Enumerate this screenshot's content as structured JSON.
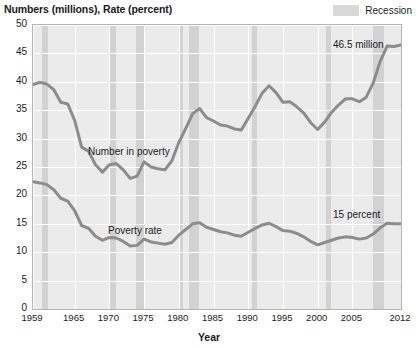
{
  "axis_title_y": "Numbers (millions), Rate (percent)",
  "axis_title_x": "Year",
  "legend": {
    "recession_label": "Recession",
    "recession_color": "#d2d2d2"
  },
  "annotations": {
    "number_in_poverty": "Number in poverty",
    "poverty_rate": "Poverty rate",
    "end_number": "46.5 million",
    "end_rate": "15 percent"
  },
  "chart_data": {
    "type": "line",
    "title": "",
    "subtitle": "",
    "xlabel": "Year",
    "ylabel": "Numbers (millions), Rate (percent)",
    "xlim": [
      1959,
      2012
    ],
    "ylim": [
      0,
      50
    ],
    "yticks": [
      0,
      5,
      10,
      15,
      20,
      25,
      30,
      35,
      40,
      45,
      50
    ],
    "xticks": [
      1959,
      1965,
      1970,
      1975,
      1980,
      1985,
      1990,
      1995,
      2000,
      2005,
      2012
    ],
    "grid": true,
    "legend_position": "top-right",
    "line_color": "#8c8c8c",
    "x": [
      1959,
      1960,
      1961,
      1962,
      1963,
      1964,
      1965,
      1966,
      1967,
      1968,
      1969,
      1970,
      1971,
      1972,
      1973,
      1974,
      1975,
      1976,
      1977,
      1978,
      1979,
      1980,
      1981,
      1982,
      1983,
      1984,
      1985,
      1986,
      1987,
      1988,
      1989,
      1990,
      1991,
      1992,
      1993,
      1994,
      1995,
      1996,
      1997,
      1998,
      1999,
      2000,
      2001,
      2002,
      2003,
      2004,
      2005,
      2006,
      2007,
      2008,
      2009,
      2010,
      2011,
      2012
    ],
    "series": [
      {
        "name": "Number in poverty",
        "unit": "millions",
        "values": [
          39.5,
          39.9,
          39.6,
          38.6,
          36.4,
          36.1,
          33.2,
          28.5,
          27.8,
          25.4,
          24.1,
          25.4,
          25.6,
          24.5,
          23.0,
          23.4,
          25.9,
          25.0,
          24.7,
          24.5,
          26.1,
          29.3,
          31.8,
          34.4,
          35.3,
          33.7,
          33.1,
          32.4,
          32.2,
          31.7,
          31.5,
          33.6,
          35.7,
          38.0,
          39.3,
          38.1,
          36.4,
          36.5,
          35.6,
          34.5,
          32.8,
          31.6,
          32.9,
          34.6,
          35.9,
          37.0,
          37.0,
          36.5,
          37.3,
          39.8,
          43.6,
          46.3,
          46.2,
          46.5
        ],
        "end_label": "46.5 million"
      },
      {
        "name": "Poverty rate",
        "unit": "percent",
        "values": [
          22.4,
          22.2,
          21.9,
          21.0,
          19.5,
          19.0,
          17.3,
          14.7,
          14.2,
          12.8,
          12.1,
          12.6,
          12.5,
          11.9,
          11.1,
          11.2,
          12.3,
          11.8,
          11.6,
          11.4,
          11.7,
          13.0,
          14.0,
          15.0,
          15.2,
          14.4,
          14.0,
          13.6,
          13.4,
          13.0,
          12.8,
          13.5,
          14.2,
          14.8,
          15.1,
          14.5,
          13.8,
          13.7,
          13.3,
          12.7,
          11.9,
          11.3,
          11.7,
          12.1,
          12.5,
          12.7,
          12.6,
          12.3,
          12.5,
          13.2,
          14.3,
          15.1,
          15.0,
          15.0
        ],
        "end_label": "15 percent"
      }
    ],
    "recession_bands": [
      {
        "start": 1960.3,
        "end": 1961.2
      },
      {
        "start": 1969.9,
        "end": 1970.9
      },
      {
        "start": 1973.9,
        "end": 1975.2
      },
      {
        "start": 1980.0,
        "end": 1980.6
      },
      {
        "start": 1981.5,
        "end": 1982.9
      },
      {
        "start": 1990.5,
        "end": 1991.2
      },
      {
        "start": 2001.2,
        "end": 2001.9
      },
      {
        "start": 2007.9,
        "end": 2009.5
      }
    ]
  }
}
